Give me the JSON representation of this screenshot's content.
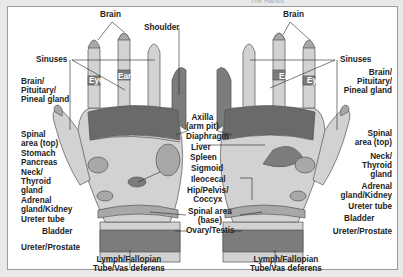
{
  "header": {
    "title": "The Hands"
  },
  "colors": {
    "light": "#d2d2d2",
    "mid": "#a8a8a8",
    "dark": "#7c7c7c",
    "darker": "#6a6a6a",
    "bg": "#ffffff"
  },
  "left_labels": {
    "brain": "Brain",
    "shoulder": "Shoulder",
    "sinuses": "Sinuses",
    "eye": "Eye",
    "ear": "Ear",
    "brain_pituitary": [
      "Brain/",
      "Pituitary/",
      "Pineal gland"
    ],
    "spinal_top": [
      "Spinal",
      "area (top)"
    ],
    "stomach": "Stomach",
    "pancreas": "Pancreas",
    "neck_thyroid": [
      "Neck/",
      "Thyroid",
      "gland"
    ],
    "adrenal": [
      "Adrenal",
      "gland/Kidney"
    ],
    "ureter_tube": "Ureter tube",
    "bladder": "Bladder",
    "ureter_prostate": "Ureter/Prostate",
    "lymph": [
      "Lymph/Fallopian",
      "Tube/Vas deferens"
    ]
  },
  "center_labels": {
    "axilla": [
      "Axilla",
      "(arm pit)"
    ],
    "diaphragm": "Diaphragm",
    "liver": "Liver",
    "spleen": "Spleen",
    "sigmoid": "Sigmoid",
    "ileocecal": "Ileocecal",
    "hip": [
      "Hip/Pelvis/",
      "Coccyx"
    ],
    "spinal_base": [
      "Spinal area",
      "(base)"
    ],
    "ovary": "Ovary/Testis"
  },
  "right_labels": {
    "brain": "Brain",
    "sinuses": "Sinuses",
    "ear": "Ear",
    "eye": "Eye",
    "brain_pituitary": [
      "Brain/",
      "Pituitary/",
      "Pineal gland"
    ],
    "spinal_top": [
      "Spinal",
      "area (top)"
    ],
    "neck_thyroid": [
      "Neck/",
      "Thyroid",
      "gland"
    ],
    "adrenal": [
      "Adrenal",
      "gland/Kidney"
    ],
    "ureter_tube": "Ureter tube",
    "bladder": "Bladder",
    "ureter_prostate": "Ureter/Prostate",
    "lymph": [
      "Lymph/Fallopian",
      "Tube/Vas deferens"
    ]
  }
}
